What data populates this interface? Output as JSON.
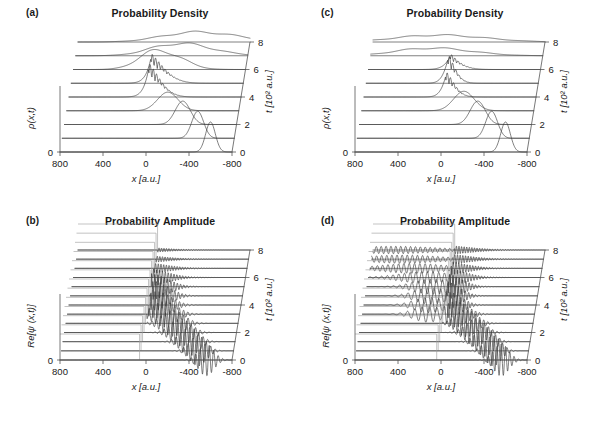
{
  "figure": {
    "width": 589,
    "height": 427,
    "background": "#ffffff",
    "trace_color": "#3a3a3a",
    "barrier_color": "#9a9a9a",
    "axis_color": "#555555"
  },
  "panels": {
    "a": {
      "tag": "(a)",
      "title": "Probability Density",
      "ylabel": "ρ(x,t)",
      "xlabel": "x [a.u.]",
      "zlabel": "t [10² a.u.]",
      "y_origin_label": "0"
    },
    "b": {
      "tag": "(b)",
      "title": "Probability Amplitude",
      "ylabel": "Re[ψ (x,t)]",
      "xlabel": "x [a.u.]",
      "zlabel": "t [10² a.u.]",
      "y_origin_label": "0"
    },
    "c": {
      "tag": "(c)",
      "title": "Probability Density",
      "ylabel": "ρ(x,t)",
      "xlabel": "x [a.u.]",
      "zlabel": "t [10² a.u.]",
      "y_origin_label": "0"
    },
    "d": {
      "tag": "(d)",
      "title": "Probability Amplitude",
      "ylabel": "Re[ψ (x,t)]",
      "xlabel": "x [a.u.]",
      "zlabel": "t [10² a.u.]",
      "y_origin_label": "0"
    }
  },
  "chart_data": [
    {
      "id": "a",
      "type": "line",
      "title": "Probability Density",
      "subtitle": "(a)",
      "xlabel": "x [a.u.]",
      "ylabel": "ρ(x,t)",
      "zlabel": "t [10² a.u.]",
      "xlim": [
        800,
        -800
      ],
      "xticks": [
        800,
        400,
        0,
        -400,
        -800
      ],
      "xticklabels": [
        "800",
        "400",
        "0",
        "-400",
        "-800"
      ],
      "zlim": [
        0,
        8
      ],
      "zticks": [
        0,
        2,
        4,
        6,
        8
      ],
      "zticklabels": [
        "0",
        "2",
        "4",
        "6",
        "8"
      ],
      "grid": false,
      "legend": false,
      "waterfall": true,
      "n_traces": 9,
      "trace_times": [
        0,
        1,
        2,
        3,
        4,
        5,
        6,
        7,
        8
      ],
      "barrier_x": 60,
      "description": "Reflecting step at x~60 a.u.; gaussian packet launched from x=-600 travels to +x, collides near t=4 forming dense standing-wave interference fringes, then reflects back toward -x",
      "series": [
        {
          "name": "t=0",
          "peak_x": -600,
          "peak_height": 1.0,
          "width": 45,
          "kind": "gaussian"
        },
        {
          "name": "t=1",
          "peak_x": -460,
          "peak_height": 0.9,
          "width": 55,
          "kind": "gaussian"
        },
        {
          "name": "t=2",
          "peak_x": -300,
          "peak_height": 0.78,
          "width": 70,
          "kind": "gaussian"
        },
        {
          "name": "t=3",
          "peak_x": -140,
          "peak_height": 0.62,
          "width": 95,
          "kind": "gaussian"
        },
        {
          "name": "t=4",
          "peak_x": 30,
          "peak_height": 0.95,
          "width": 120,
          "kind": "interference"
        },
        {
          "name": "t=5",
          "peak_x": 20,
          "peak_height": 0.85,
          "width": 140,
          "kind": "interference"
        },
        {
          "name": "t=6",
          "peak_x": -60,
          "peak_height": 0.5,
          "width": 180,
          "kind": "broad"
        },
        {
          "name": "t=7",
          "peak_x": -260,
          "peak_height": 0.32,
          "width": 260,
          "kind": "broad"
        },
        {
          "name": "t=8",
          "peak_x": -430,
          "peak_height": 0.26,
          "width": 320,
          "kind": "broad"
        }
      ]
    },
    {
      "id": "b",
      "type": "line",
      "title": "Probability Amplitude",
      "subtitle": "(b)",
      "xlabel": "x [a.u.]",
      "ylabel": "Re[ψ (x,t)]",
      "zlabel": "t [10² a.u.]",
      "xlim": [
        800,
        -800
      ],
      "xticks": [
        800,
        400,
        0,
        -400,
        -800
      ],
      "xticklabels": [
        "800",
        "400",
        "0",
        "-400",
        "-800"
      ],
      "zlim": [
        0,
        8
      ],
      "zticks": [
        0,
        2,
        4,
        6,
        8
      ],
      "zticklabels": [
        "0",
        "2",
        "4",
        "6",
        "8"
      ],
      "grid": false,
      "legend": false,
      "waterfall": true,
      "n_traces": 13,
      "barrier_x": 60,
      "description": "Real part of wavefunction for the reflecting step; oscillatory packet moves from right to left, is totally reflected at the step near x~60, leaving no transmitted amplitude beyond the step",
      "series": [
        {
          "name": "trace-1",
          "center_x": -560,
          "amplitude": 1.0,
          "envelope_width": 70,
          "wavelength": 42,
          "transmitted": false
        },
        {
          "name": "trace-2",
          "center_x": -470,
          "amplitude": 0.95,
          "envelope_width": 78,
          "wavelength": 42,
          "transmitted": false
        },
        {
          "name": "trace-3",
          "center_x": -380,
          "amplitude": 0.9,
          "envelope_width": 86,
          "wavelength": 42,
          "transmitted": false
        },
        {
          "name": "trace-4",
          "center_x": -285,
          "amplitude": 0.86,
          "envelope_width": 95,
          "wavelength": 42,
          "transmitted": false
        },
        {
          "name": "trace-5",
          "center_x": -195,
          "amplitude": 0.82,
          "envelope_width": 105,
          "wavelength": 42,
          "transmitted": false
        },
        {
          "name": "trace-6",
          "center_x": -105,
          "amplitude": 0.8,
          "envelope_width": 115,
          "wavelength": 40,
          "transmitted": false
        },
        {
          "name": "trace-7",
          "center_x": -20,
          "amplitude": 0.85,
          "envelope_width": 125,
          "wavelength": 38,
          "transmitted": false
        },
        {
          "name": "trace-8",
          "center_x": 20,
          "amplitude": 0.9,
          "envelope_width": 135,
          "wavelength": 34,
          "transmitted": false
        },
        {
          "name": "trace-9",
          "center_x": 70,
          "amplitude": 0.82,
          "envelope_width": 155,
          "wavelength": 30,
          "transmitted": false
        },
        {
          "name": "trace-10",
          "center_x": 150,
          "amplitude": 0.6,
          "envelope_width": 200,
          "wavelength": 27,
          "transmitted": false
        },
        {
          "name": "trace-11",
          "center_x": 260,
          "amplitude": 0.45,
          "envelope_width": 250,
          "wavelength": 25,
          "transmitted": false
        },
        {
          "name": "trace-12",
          "center_x": 380,
          "amplitude": 0.35,
          "envelope_width": 300,
          "wavelength": 24,
          "transmitted": false
        },
        {
          "name": "trace-13",
          "center_x": 480,
          "amplitude": 0.3,
          "envelope_width": 340,
          "wavelength": 23,
          "transmitted": false
        }
      ]
    },
    {
      "id": "c",
      "type": "line",
      "title": "Probability Density",
      "subtitle": "(c)",
      "xlabel": "x [a.u.]",
      "ylabel": "ρ(x,t)",
      "zlabel": "t [10² a.u.]",
      "xlim": [
        800,
        -800
      ],
      "xticks": [
        800,
        400,
        0,
        -400,
        -800
      ],
      "xticklabels": [
        "800",
        "400",
        "0",
        "-400",
        "-800"
      ],
      "zlim": [
        0,
        8
      ],
      "zticks": [
        0,
        2,
        4,
        6,
        8
      ],
      "zticklabels": [
        "0",
        "2",
        "4",
        "6",
        "8"
      ],
      "grid": false,
      "legend": false,
      "waterfall": true,
      "n_traces": 9,
      "barrier_x": 40,
      "description": "Transmitting/partially reflecting step; packet collides near t=5 producing a narrower, weaker interference burst than (a), and part of the density continues past the step",
      "series": [
        {
          "name": "t=0",
          "peak_x": -600,
          "peak_height": 1.0,
          "width": 45,
          "kind": "gaussian"
        },
        {
          "name": "t=1",
          "peak_x": -450,
          "peak_height": 0.9,
          "width": 55,
          "kind": "gaussian"
        },
        {
          "name": "t=2",
          "peak_x": -300,
          "peak_height": 0.78,
          "width": 70,
          "kind": "gaussian"
        },
        {
          "name": "t=3",
          "peak_x": -150,
          "peak_height": 0.65,
          "width": 95,
          "kind": "gaussian"
        },
        {
          "name": "t=4",
          "peak_x": 30,
          "peak_height": 0.7,
          "width": 90,
          "kind": "interference"
        },
        {
          "name": "t=5",
          "peak_x": 45,
          "peak_height": 0.8,
          "width": 85,
          "kind": "interference"
        },
        {
          "name": "t=6",
          "peak_x": 70,
          "peak_height": 0.45,
          "width": 130,
          "kind": "interference"
        },
        {
          "name": "t=7",
          "peak_x": 120,
          "peak_height": 0.2,
          "width": 320,
          "kind": "broad"
        },
        {
          "name": "t=8",
          "peak_x": 60,
          "peak_height": 0.18,
          "width": 380,
          "kind": "broad"
        }
      ]
    },
    {
      "id": "d",
      "type": "line",
      "title": "Probability Amplitude",
      "subtitle": "(d)",
      "xlabel": "x [a.u.]",
      "ylabel": "Re[ψ (x,t)]",
      "zlabel": "t [10² a.u.]",
      "xlim": [
        800,
        -800
      ],
      "xticks": [
        800,
        400,
        0,
        -400,
        -800
      ],
      "xticklabels": [
        "800",
        "400",
        "0",
        "-400",
        "-800"
      ],
      "zlim": [
        0,
        8
      ],
      "zticks": [
        0,
        2,
        4,
        6,
        8
      ],
      "zticklabels": [
        "0",
        "2",
        "4",
        "6",
        "8"
      ],
      "grid": false,
      "legend": false,
      "waterfall": true,
      "n_traces": 13,
      "barrier_x": 40,
      "description": "Real part of wavefunction for the transmitting step; incident packet splits at x~40 into a reflected component travelling to -x and a longer-wavelength transmitted component spreading to +x",
      "series": [
        {
          "name": "trace-1",
          "center_x": -560,
          "amplitude": 1.0,
          "envelope_width": 70,
          "wavelength": 40,
          "transmitted": false
        },
        {
          "name": "trace-2",
          "center_x": -470,
          "amplitude": 0.95,
          "envelope_width": 75,
          "wavelength": 40,
          "transmitted": false
        },
        {
          "name": "trace-3",
          "center_x": -380,
          "amplitude": 0.92,
          "envelope_width": 82,
          "wavelength": 40,
          "transmitted": false
        },
        {
          "name": "trace-4",
          "center_x": -280,
          "amplitude": 0.88,
          "envelope_width": 90,
          "wavelength": 40,
          "transmitted": false
        },
        {
          "name": "trace-5",
          "center_x": -180,
          "amplitude": 0.85,
          "envelope_width": 98,
          "wavelength": 38,
          "transmitted": false
        },
        {
          "name": "trace-6",
          "center_x": -70,
          "amplitude": 0.82,
          "envelope_width": 108,
          "wavelength": 36,
          "transmitted": true
        },
        {
          "name": "trace-7",
          "center_x": 10,
          "amplitude": 0.8,
          "envelope_width": 115,
          "wavelength": 34,
          "transmitted": true
        },
        {
          "name": "trace-8",
          "center_x": 40,
          "amplitude": 0.85,
          "envelope_width": 120,
          "wavelength": 32,
          "transmitted": true
        },
        {
          "name": "trace-9",
          "center_x": 60,
          "amplitude": 0.78,
          "envelope_width": 140,
          "wavelength": 30,
          "transmitted": true
        },
        {
          "name": "trace-10",
          "center_x": 110,
          "amplitude": 0.6,
          "envelope_width": 190,
          "wavelength": 28,
          "transmitted": true
        },
        {
          "name": "trace-11",
          "center_x": 190,
          "amplitude": 0.5,
          "envelope_width": 240,
          "wavelength": 26,
          "transmitted": true
        },
        {
          "name": "trace-12",
          "center_x": 260,
          "amplitude": 0.42,
          "envelope_width": 290,
          "wavelength": 25,
          "transmitted": true
        },
        {
          "name": "trace-13",
          "center_x": 320,
          "amplitude": 0.38,
          "envelope_width": 330,
          "wavelength": 24,
          "transmitted": true
        }
      ]
    }
  ]
}
